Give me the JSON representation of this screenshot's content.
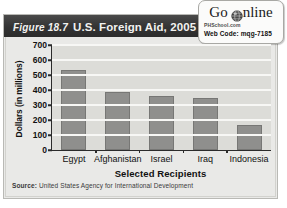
{
  "figure": {
    "number": "Figure 18.7",
    "title": "U.S. Foreign Aid, 2005"
  },
  "badge": {
    "logo_go": "Go",
    "logo_nline": "nline",
    "globe_icon": "globe-icon",
    "site": "PHSchool.com",
    "code_label": "Web Code:",
    "code_value": "mqg-7185"
  },
  "source": {
    "label": "Source:",
    "text": "United States Agency for International Development"
  },
  "chart_data": {
    "type": "bar",
    "title": "U.S. Foreign Aid, 2005",
    "xlabel": "Selected Recipients",
    "ylabel": "Dollars (in millions)",
    "categories": [
      "Egypt",
      "Afghanistan",
      "Israel",
      "Iraq",
      "Indonesia"
    ],
    "values": [
      535,
      385,
      357,
      347,
      165
    ],
    "ylim": [
      0,
      700
    ],
    "ytick_step": 100,
    "yticks": [
      0,
      100,
      200,
      300,
      400,
      500,
      600,
      700
    ],
    "ytick_labels": [
      "0",
      "100",
      "200",
      "300",
      "400",
      "500",
      "600",
      "700"
    ],
    "grid": true,
    "legend": false,
    "bar_color": "#8f8f8d",
    "plot_background": "#dcdcd8",
    "gridline_color": "#f7f7f5"
  }
}
